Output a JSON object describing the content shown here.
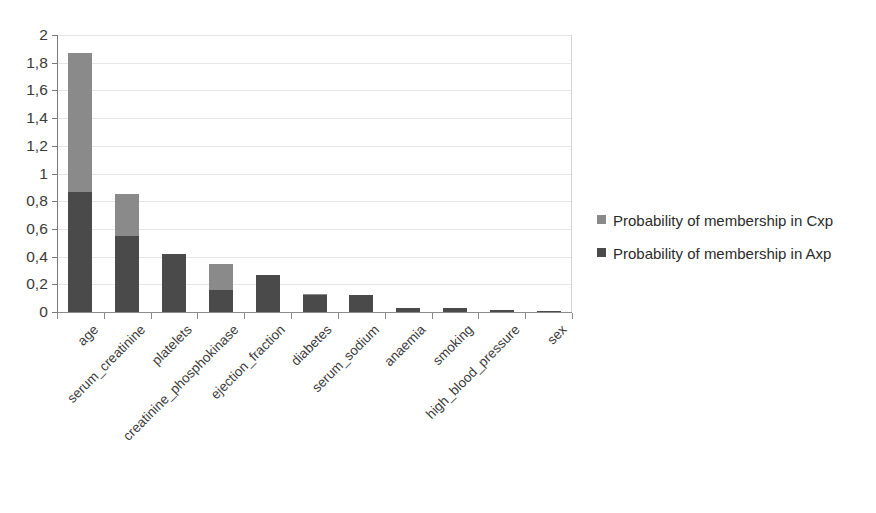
{
  "chart_data": {
    "type": "bar",
    "subtype": "stacked-bar",
    "title": "",
    "xlabel": "",
    "ylabel": "",
    "ylim": [
      0,
      2
    ],
    "ytick_step": 0.2,
    "ytick_labels": [
      "0",
      "0,2",
      "0,4",
      "0,6",
      "0,8",
      "1",
      "1,2",
      "1,4",
      "1,6",
      "1,8",
      "2"
    ],
    "ytick_values": [
      0,
      0.2,
      0.4,
      0.6,
      0.8,
      1,
      1.2,
      1.4,
      1.6,
      1.8,
      2
    ],
    "decimal_separator": ",",
    "grid": true,
    "grid_axis": "y",
    "legend_position": "right",
    "categories": [
      "age",
      "serum_creatinine",
      "platelets",
      "creatinine_phosphokinase",
      "ejection_fraction",
      "diabetes",
      "serum_sodium",
      "anaemia",
      "smoking",
      "high_blood_pressure",
      "sex"
    ],
    "series": [
      {
        "name": "Probability of membership in Axp",
        "key": "axp",
        "color": "#4a4a4a",
        "values": [
          0.87,
          0.55,
          0.42,
          0.16,
          0.27,
          0.12,
          0.12,
          0.03,
          0.03,
          0.015,
          0.01
        ]
      },
      {
        "name": "Probability of membership in Cxp",
        "key": "cxp",
        "color": "#8a8a8a",
        "values": [
          1.0,
          0.3,
          0.0,
          0.19,
          0.0,
          0.01,
          0.0,
          0.0,
          0.0,
          0.0,
          0.0
        ]
      }
    ],
    "totals": [
      1.87,
      0.85,
      0.42,
      0.35,
      0.27,
      0.13,
      0.12,
      0.03,
      0.03,
      0.015,
      0.01
    ]
  },
  "legend": {
    "items": [
      {
        "label": "Probability of membership in Cxp",
        "color": "#8a8a8a",
        "swatch_name": "legend-swatch-cxp"
      },
      {
        "label": "Probability of membership in Axp",
        "color": "#4a4a4a",
        "swatch_name": "legend-swatch-axp"
      }
    ]
  }
}
